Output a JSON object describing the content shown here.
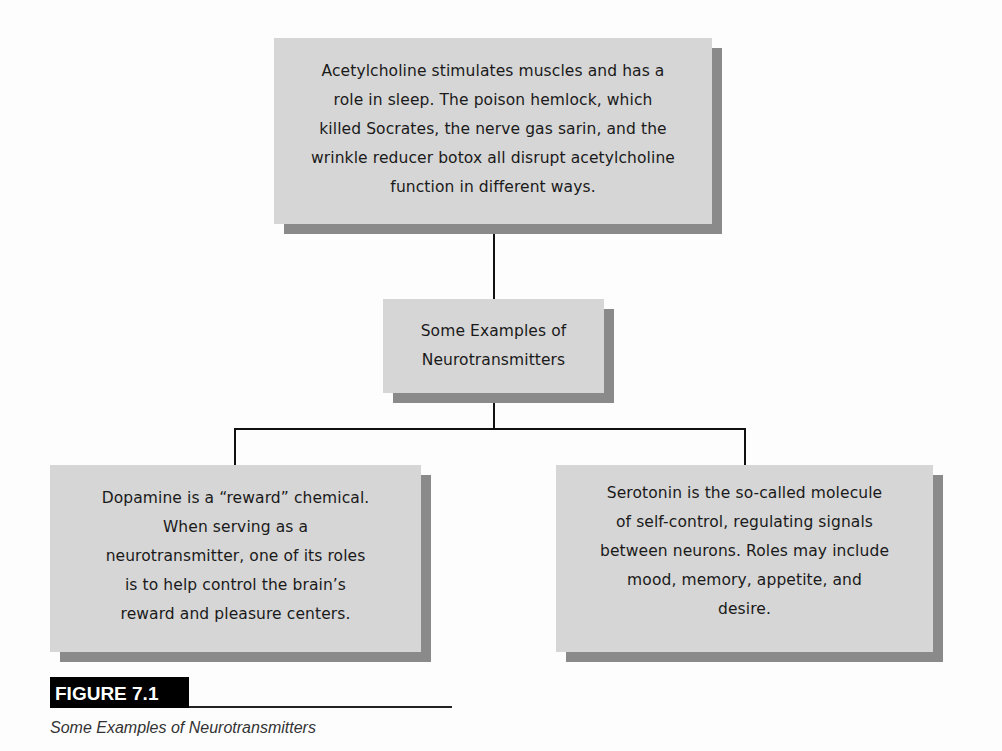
{
  "diagram": {
    "type": "hierarchy",
    "nodes": {
      "top": {
        "text": "Acetylcholine stimulates muscles and has a role in sleep. The poison hemlock, which killed Socrates, the nerve gas sarin, and  the wrinkle reducer botox all disrupt acetylcholine function in different ways.",
        "lines": [
          "Acetylcholine stimulates muscles and has a",
          "role in sleep. The poison hemlock, which",
          "killed Socrates, the nerve gas sarin, and  the",
          "wrinkle reducer botox all disrupt acetylcholine",
          "function in different ways."
        ]
      },
      "middle": {
        "text": "Some Examples of Neurotransmitters",
        "lines": [
          "Some Examples of",
          "Neurotransmitters"
        ]
      },
      "left": {
        "text": "Dopamine is a “reward” chemical. When serving as a neurotransmitter, one of its roles is to help control the brain’s reward and pleasure centers.",
        "lines": [
          "Dopamine is a “reward” chemical.",
          "When serving as a",
          "neurotransmitter, one of its roles",
          "is to help control the brain’s",
          "reward and pleasure centers."
        ]
      },
      "right": {
        "text": "Serotonin is the so-called molecule of self-control, regulating signals between neurons. Roles may include mood, memory, appetite, and desire.",
        "lines": [
          "Serotonin is the so-called molecule",
          "of self-control, regulating signals",
          "between neurons. Roles may include",
          "mood, memory, appetite, and",
          "desire."
        ]
      }
    },
    "edges": [
      {
        "from": "top",
        "to": "middle"
      },
      {
        "from": "middle",
        "to": "left"
      },
      {
        "from": "middle",
        "to": "right"
      }
    ],
    "colors": {
      "box_fill": "#d6d6d6",
      "box_shadow": "#8a8a8a",
      "connector": "#111111",
      "text": "#1a1a1a"
    }
  },
  "figure": {
    "label": "FIGURE 7.1",
    "caption": "Some Examples of Neurotransmitters",
    "label_bg": "#000000",
    "label_fg": "#ffffff"
  }
}
